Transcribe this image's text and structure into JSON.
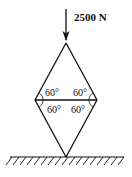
{
  "load": {
    "label": "2500 N",
    "direction": "downward"
  },
  "structure": {
    "type": "rhombus truss",
    "angles": {
      "top_left": "60°",
      "top_right": "60°",
      "bottom_left": "60°",
      "bottom_right": "60°"
    }
  },
  "support": {
    "type": "ground",
    "hatched": true
  },
  "colors": {
    "ink": "#111111",
    "background": "#ffffff"
  }
}
